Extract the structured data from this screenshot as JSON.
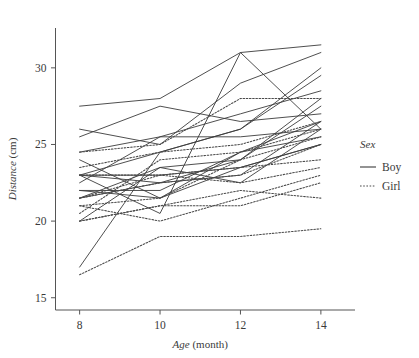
{
  "chart_data": {
    "type": "line",
    "title": "",
    "subtitle": "",
    "xlabel_italic": "Age",
    "xlabel_rest": " (month)",
    "ylabel_italic": "Distance",
    "ylabel_rest": " (cm)",
    "x": [
      8,
      10,
      12,
      14
    ],
    "xticks": [
      "8",
      "10",
      "12",
      "14"
    ],
    "yticks": [
      "15",
      "20",
      "25",
      "30"
    ],
    "ytickvals": [
      15,
      20,
      25,
      30
    ],
    "xlim": [
      7.4,
      14.6
    ],
    "ylim": [
      14.2,
      32.6
    ],
    "grid": false,
    "legend_position": "right",
    "legend_title": "Sex",
    "legend_entries": [
      {
        "label": "Boy",
        "style": "solid",
        "color": "#3b3b3b"
      },
      {
        "label": "Girl",
        "style": "dotted",
        "color": "#4a4a4a"
      }
    ],
    "series": [
      {
        "name": "M01",
        "group": "Boy",
        "values": [
          26.0,
          25.0,
          29.0,
          31.0
        ]
      },
      {
        "name": "M02",
        "group": "Boy",
        "values": [
          21.5,
          22.5,
          23.0,
          26.5
        ]
      },
      {
        "name": "M03",
        "group": "Boy",
        "values": [
          23.0,
          22.5,
          24.0,
          27.5
        ]
      },
      {
        "name": "M04",
        "group": "Boy",
        "values": [
          25.5,
          27.5,
          26.5,
          27.0
        ]
      },
      {
        "name": "M05",
        "group": "Boy",
        "values": [
          20.0,
          23.5,
          22.5,
          26.0
        ]
      },
      {
        "name": "M06",
        "group": "Boy",
        "values": [
          24.5,
          25.5,
          27.0,
          28.5
        ]
      },
      {
        "name": "M07",
        "group": "Boy",
        "values": [
          22.0,
          22.0,
          24.5,
          26.5
        ]
      },
      {
        "name": "M08",
        "group": "Boy",
        "values": [
          24.0,
          21.5,
          24.5,
          25.5
        ]
      },
      {
        "name": "M09",
        "group": "Boy",
        "values": [
          23.0,
          20.5,
          31.0,
          26.0
        ]
      },
      {
        "name": "M10",
        "group": "Boy",
        "values": [
          27.5,
          28.0,
          31.0,
          31.5
        ]
      },
      {
        "name": "M11",
        "group": "Boy",
        "values": [
          23.0,
          23.0,
          23.5,
          25.0
        ]
      },
      {
        "name": "M12",
        "group": "Boy",
        "values": [
          21.5,
          23.5,
          24.0,
          28.0
        ]
      },
      {
        "name": "M13",
        "group": "Boy",
        "values": [
          17.0,
          24.5,
          26.0,
          29.5
        ]
      },
      {
        "name": "M14",
        "group": "Boy",
        "values": [
          22.5,
          25.5,
          25.5,
          26.0
        ]
      },
      {
        "name": "M15",
        "group": "Boy",
        "values": [
          23.0,
          24.5,
          26.0,
          30.0
        ]
      },
      {
        "name": "M16",
        "group": "Boy",
        "values": [
          22.0,
          21.5,
          23.5,
          25.0
        ]
      },
      {
        "name": "F01",
        "group": "Girl",
        "values": [
          21.0,
          20.0,
          21.5,
          23.0
        ]
      },
      {
        "name": "F02",
        "group": "Girl",
        "values": [
          21.0,
          21.5,
          24.0,
          25.5
        ]
      },
      {
        "name": "F03",
        "group": "Girl",
        "values": [
          20.5,
          24.0,
          24.5,
          26.0
        ]
      },
      {
        "name": "F04",
        "group": "Girl",
        "values": [
          23.5,
          24.5,
          25.0,
          26.5
        ]
      },
      {
        "name": "F05",
        "group": "Girl",
        "values": [
          21.5,
          23.0,
          22.5,
          23.5
        ]
      },
      {
        "name": "F06",
        "group": "Girl",
        "values": [
          20.0,
          21.0,
          21.0,
          22.5
        ]
      },
      {
        "name": "F07",
        "group": "Girl",
        "values": [
          21.5,
          22.5,
          23.0,
          25.0
        ]
      },
      {
        "name": "F08",
        "group": "Girl",
        "values": [
          23.0,
          23.0,
          23.5,
          24.0
        ]
      },
      {
        "name": "F09",
        "group": "Girl",
        "values": [
          20.0,
          21.0,
          22.0,
          21.5
        ]
      },
      {
        "name": "F10",
        "group": "Girl",
        "values": [
          16.5,
          19.0,
          19.0,
          19.5
        ]
      },
      {
        "name": "F11",
        "group": "Girl",
        "values": [
          24.5,
          25.0,
          28.0,
          28.0
        ]
      }
    ]
  }
}
